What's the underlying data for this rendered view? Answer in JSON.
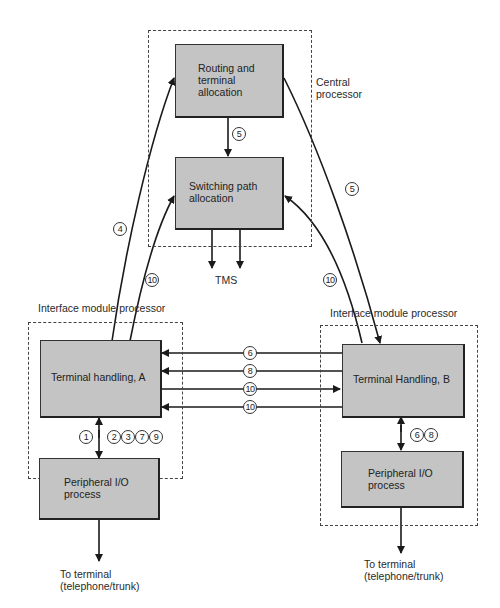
{
  "central_processor": {
    "label": "Central\nprocessor",
    "routing_block": "Routing and\nterminal\nallocation",
    "switching_block": "Switching path\nallocation",
    "tms_label": "TMS"
  },
  "module_a": {
    "label": "Interface module processor",
    "terminal_block": "Terminal handling, A",
    "peripheral_block": "Peripheral I/O\nprocess",
    "terminal_label": "To terminal\n(telephone/trunk)",
    "link_labels_left": [
      "1"
    ],
    "link_labels_right": [
      "2",
      "3",
      "7",
      "9"
    ]
  },
  "module_b": {
    "label": "Interface module processor",
    "terminal_block": "Terminal Handling, B",
    "peripheral_block": "Peripheral I/O\nprocess",
    "terminal_label": "To terminal\n(telephone/trunk)",
    "link_labels": [
      "6",
      "8"
    ]
  },
  "messages": {
    "routing_to_switching": "5",
    "a_to_routing": "4",
    "a_to_switching": "10",
    "routing_to_b": "5",
    "b_to_switching": "10",
    "horizontal": [
      {
        "label": "6",
        "direction": "B→A"
      },
      {
        "label": "8",
        "direction": "B→A"
      },
      {
        "label": "10",
        "direction": "A→B"
      },
      {
        "label": "10",
        "direction": "B→A"
      }
    ]
  },
  "colors": {
    "block_fill": "#c4c4c4",
    "line": "#1a1a1a"
  }
}
